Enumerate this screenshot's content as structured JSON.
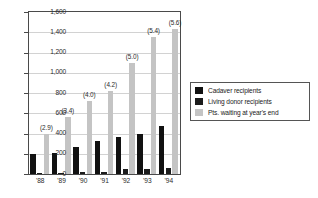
{
  "chart_data": {
    "type": "bar",
    "title": "",
    "subtitle": "",
    "xlabel": "",
    "ylabel": "",
    "categories": [
      "'88",
      "'89",
      "'90",
      "'91",
      "'92",
      "'93",
      "'94"
    ],
    "ylim": [
      0,
      1600
    ],
    "ytick_values": [
      0,
      200,
      400,
      600,
      800,
      1000,
      1200,
      1400,
      1600
    ],
    "ytick_labels": [
      "0",
      "200",
      "400",
      "600",
      "800",
      "1,000",
      "1,200",
      "1,400",
      "1,600"
    ],
    "grid": true,
    "legend_position": "inside-upper-right",
    "series": [
      {
        "name": "Cadaver recipients",
        "color": "#111111",
        "values": [
          200,
          205,
          270,
          325,
          370,
          400,
          470
        ]
      },
      {
        "name": "Living donor recipients",
        "color": "#1c1c1c",
        "values": [
          8,
          6,
          22,
          20,
          50,
          45,
          55
        ]
      },
      {
        "name": "Pts. waiting at year's end",
        "color": "#c4c4c4",
        "values": [
          400,
          560,
          720,
          820,
          1100,
          1350,
          1430
        ]
      }
    ],
    "annotations": [
      "(2.9)",
      "(3.4)",
      "(4.0)",
      "(4.2)",
      "(5.0)",
      "(5.4)",
      "(5.6)"
    ],
    "annotation_series": "Pts. waiting at year's end"
  },
  "legend": {
    "items": [
      {
        "label": "Cadaver recipients",
        "swatch": "#111111"
      },
      {
        "label": "Living donor recipients",
        "swatch": "#1c1c1c"
      },
      {
        "label": "Pts. waiting at year's end",
        "swatch": "#c4c4c4"
      }
    ]
  },
  "colors": {
    "axis": "#4a4a4a",
    "grid": "#d2d2d2",
    "text": "#2b2b2b",
    "background": "#ffffff"
  }
}
